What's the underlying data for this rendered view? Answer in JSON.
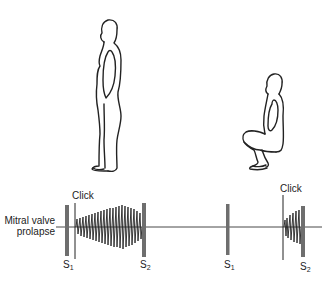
{
  "figure": {
    "panels": [
      {
        "posture": "standing",
        "description": "Standing figure"
      },
      {
        "posture": "squatting",
        "description": "Squatting figure"
      }
    ],
    "row_label_line1": "Mitral valve",
    "row_label_line2": "prolapse",
    "click_label_1": "Click",
    "click_label_2": "Click",
    "s1_label_1": "S",
    "s1_sub_1": "1",
    "s2_label_1": "S",
    "s2_sub_1": "2",
    "s1_label_2": "S",
    "s1_sub_2": "1",
    "s2_label_2": "S",
    "s2_sub_2": "2"
  },
  "colors": {
    "line": "#222222",
    "heart_sound_bar": "#6e6e6e",
    "background": "#ffffff"
  }
}
